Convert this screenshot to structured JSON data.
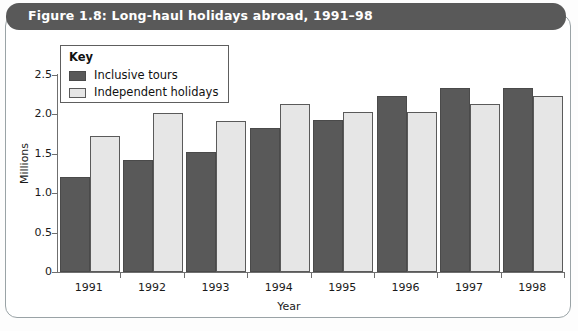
{
  "figure": {
    "title": "Figure 1.8: Long-haul holidays abroad, 1991–98",
    "title_bg": "#595959",
    "title_color": "#ffffff"
  },
  "legend": {
    "heading": "Key",
    "entries": [
      {
        "label": "Inclusive tours",
        "color": "#595959"
      },
      {
        "label": "Independent holidays",
        "color": "#e6e6e6"
      }
    ]
  },
  "chart_data": {
    "type": "bar",
    "title": "Figure 1.8: Long-haul holidays abroad, 1991–98",
    "categories": [
      "1991",
      "1992",
      "1993",
      "1994",
      "1995",
      "1996",
      "1997",
      "1998"
    ],
    "series": [
      {
        "name": "Inclusive tours",
        "color": "#595959",
        "values": [
          1.21,
          1.42,
          1.52,
          1.83,
          1.93,
          2.23,
          2.34,
          2.34
        ]
      },
      {
        "name": "Independent holidays",
        "color": "#e6e6e6",
        "values": [
          1.72,
          2.02,
          1.92,
          2.13,
          2.03,
          2.03,
          2.13,
          2.23
        ]
      }
    ],
    "xlabel": "Year",
    "ylabel": "Millions",
    "ylim": [
      0,
      2.5
    ],
    "yticks": [
      0,
      0.5,
      1.0,
      1.5,
      2.0,
      2.5
    ],
    "ytick_labels": [
      "0",
      "0.5",
      "1.0",
      "1.5",
      "2.0",
      "2.5"
    ],
    "grid": false,
    "legend_position": "upper-left-inside"
  }
}
